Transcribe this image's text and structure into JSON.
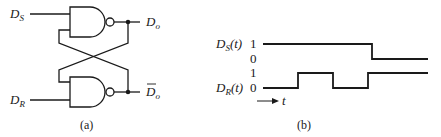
{
  "figure": {
    "panel_a": {
      "caption": "(a)",
      "inputs": {
        "set": {
          "main": "D",
          "sub": "S"
        },
        "reset": {
          "main": "D",
          "sub": "R"
        }
      },
      "outputs": {
        "q": {
          "main": "D",
          "sub": "o"
        },
        "q_bar": {
          "main": "D",
          "sub": "o",
          "overbar": true
        }
      },
      "gates": [
        "NAND",
        "NAND"
      ],
      "description": "Cross-coupled NAND gate latch"
    },
    "panel_b": {
      "caption": "(b)",
      "signals": [
        {
          "name_main": "D",
          "name_sub": "S",
          "name_arg": "(t)",
          "level_high": "1",
          "level_low": "0"
        },
        {
          "name_main": "D",
          "name_sub": "R",
          "name_arg": "(t)",
          "level_high": "1",
          "level_low": "0"
        }
      ],
      "time_axis_label": "t",
      "description": "Timing waveforms of set and reset inputs"
    }
  },
  "waveforms": {
    "D_S": [
      [
        0,
        1
      ],
      [
        0.66,
        1
      ],
      [
        0.66,
        0
      ],
      [
        1.0,
        0
      ]
    ],
    "D_R": [
      [
        0,
        0
      ],
      [
        0.21,
        0
      ],
      [
        0.21,
        1
      ],
      [
        0.42,
        1
      ],
      [
        0.42,
        0
      ],
      [
        0.63,
        0
      ],
      [
        0.63,
        1
      ],
      [
        1.0,
        1
      ]
    ]
  },
  "colors": {
    "ink": "#1a1a1a",
    "background": "#ffffff"
  }
}
